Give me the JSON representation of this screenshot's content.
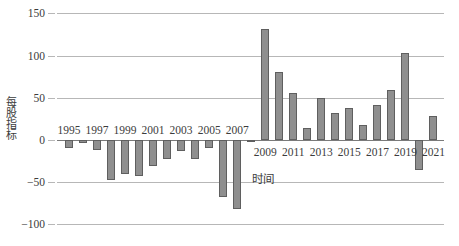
{
  "chart_data": {
    "type": "bar",
    "title": "",
    "xlabel": "时间",
    "ylabel": "每股指标",
    "ylim": [
      -100,
      150
    ],
    "yticks": [
      150,
      100,
      50,
      0,
      -50,
      -100
    ],
    "ytick_labels": [
      "150",
      "100",
      "50",
      "0",
      "−50",
      "−100"
    ],
    "grid": true,
    "legend": "none",
    "categories": [
      "1995",
      "1996",
      "1997",
      "1998",
      "1999",
      "2000",
      "2001",
      "2002",
      "2003",
      "2004",
      "2005",
      "2006",
      "2007",
      "2008",
      "2009",
      "2010",
      "2011",
      "2012",
      "2013",
      "2014",
      "2015",
      "2016",
      "2017",
      "2018",
      "2019",
      "2020",
      "2021"
    ],
    "xtick_labels_shown": [
      "1995",
      "1997",
      "1999",
      "2001",
      "2003",
      "2005",
      "2007",
      "2009",
      "2011",
      "2013",
      "2015",
      "2017",
      "2019",
      "2021"
    ],
    "values": [
      -9,
      -4,
      -12,
      -47,
      -40,
      -43,
      -31,
      -23,
      -13,
      -22,
      -10,
      -68,
      -82,
      -1,
      131,
      81,
      56,
      14,
      50,
      32,
      38,
      18,
      42,
      59,
      103,
      -35,
      29
    ],
    "bar_color": "#8f8f8f",
    "bar_border_color": "#5f5f5f",
    "grid_color": "#b7b7b7",
    "axis_color": "#7a7a7a",
    "text_color": "#3c3c3c"
  }
}
